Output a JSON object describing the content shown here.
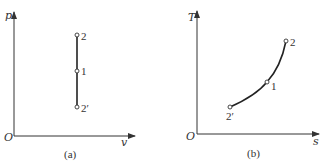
{
  "panels": [
    {
      "id": "a",
      "caption": "(a)",
      "origin_label": "O",
      "x_axis_label": "v",
      "y_axis_label": "p",
      "process": "isochoric (vertical line in p-v plane)",
      "points": [
        {
          "label": "2"
        },
        {
          "label": "1"
        },
        {
          "label": "2′"
        }
      ]
    },
    {
      "id": "b",
      "caption": "(b)",
      "origin_label": "O",
      "x_axis_label": "s",
      "y_axis_label": "T",
      "process": "isochoric curve (rising, concave up in T-s plane)",
      "points": [
        {
          "label": "2′"
        },
        {
          "label": "1"
        },
        {
          "label": "2"
        }
      ]
    }
  ]
}
